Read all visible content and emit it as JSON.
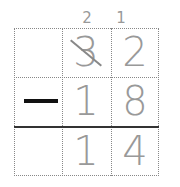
{
  "problem": {
    "carries": {
      "tens": "2",
      "ones": "1"
    },
    "top": {
      "tens": "3",
      "ones": "2",
      "tens_crossed": true
    },
    "operator": "−",
    "bottom": {
      "tens": "1",
      "ones": "8"
    },
    "result": {
      "tens": "1",
      "ones": "4"
    }
  },
  "colors": {
    "digit": "#999999",
    "rule": "#333333",
    "operator": "#111111"
  }
}
